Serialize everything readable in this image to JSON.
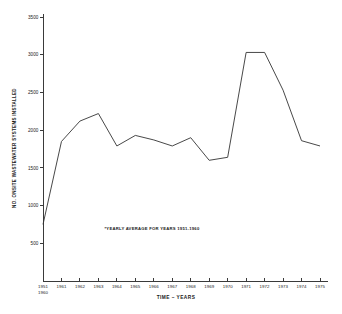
{
  "chart_data": {
    "type": "line",
    "title": "",
    "xlabel": "TIME – YEARS",
    "ylabel": "NO. ONSITE WASTEWATER SYSTEMS INSTALLED",
    "annotation": "*YEARLY AVERAGE FOR YEARS 1951-1960",
    "grid": false,
    "legend": "none",
    "ylim": [
      0,
      3500
    ],
    "yticks": [
      500,
      1000,
      1500,
      2000,
      2500,
      3000,
      3500
    ],
    "ytick_labels": [
      "500",
      "1000",
      "1500",
      "2000",
      "2500",
      "3000",
      "3500"
    ],
    "categories": [
      "1951*",
      "1961",
      "1962",
      "1963",
      "1964",
      "1965",
      "1966",
      "1967",
      "1968",
      "1969",
      "1970",
      "1971",
      "1972",
      "1973",
      "1974",
      "1975"
    ],
    "xtick_labels": [
      "1951",
      "1961",
      "1962",
      "1963",
      "1964",
      "1965",
      "1966",
      "1967",
      "1968",
      "1969",
      "1970",
      "1971",
      "1972",
      "1973",
      "1974",
      "1975"
    ],
    "first_tick_sublabel": "1960",
    "values": [
      750,
      1850,
      2120,
      2220,
      1790,
      1930,
      1870,
      1790,
      1900,
      1600,
      1640,
      3030,
      3030,
      2530,
      1860,
      1790
    ],
    "series": [
      {
        "name": "Onsite wastewater systems installed",
        "values": [
          750,
          1850,
          2120,
          2220,
          1790,
          1930,
          1870,
          1790,
          1900,
          1600,
          1640,
          3030,
          3030,
          2530,
          1860,
          1790
        ]
      }
    ],
    "line_color": "#333333",
    "axis_color": "#3a3a3a",
    "background_color": "#ffffff"
  }
}
